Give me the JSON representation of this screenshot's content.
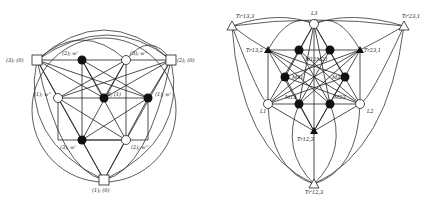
{
  "left_graph": {
    "nodes": [
      {
        "id": "a",
        "label": "(3); (0)",
        "shape": "square",
        "x": 37,
        "y": 60,
        "lx": 6,
        "ly": 62
      },
      {
        "id": "b",
        "label": "(2); w'",
        "shape": "filled",
        "x": 82,
        "y": 60,
        "lx": 62,
        "ly": 55
      },
      {
        "id": "c",
        "label": "(3); w''",
        "shape": "open",
        "x": 126,
        "y": 60,
        "lx": 130,
        "ly": 55
      },
      {
        "id": "d",
        "label": "(2); (0)",
        "shape": "square",
        "x": 171,
        "y": 60,
        "lx": 177,
        "ly": 62
      },
      {
        "id": "e",
        "label": "(1); w''",
        "shape": "open",
        "x": 58,
        "y": 98,
        "lx": 34,
        "ly": 96
      },
      {
        "id": "f",
        "label": "B; (1)",
        "shape": "filled",
        "x": 104,
        "y": 98,
        "lx": 107,
        "ly": 96
      },
      {
        "id": "g",
        "label": "(1); w'",
        "shape": "filled",
        "x": 148,
        "y": 98,
        "lx": 155,
        "ly": 96
      },
      {
        "id": "h",
        "label": "(3); w'",
        "shape": "filled",
        "x": 82,
        "y": 140,
        "lx": 60,
        "ly": 149
      },
      {
        "id": "i",
        "label": "(2); w''",
        "shape": "open",
        "x": 126,
        "y": 140,
        "lx": 131,
        "ly": 149
      },
      {
        "id": "j",
        "label": "(1); (0)",
        "shape": "square",
        "x": 104,
        "y": 180,
        "lx": 92,
        "ly": 192
      }
    ]
  },
  "right_graph": {
    "nodes": [
      {
        "id": "L3",
        "label": "L3",
        "shape": "open",
        "x": 314,
        "y": 24,
        "lx": 311,
        "ly": 15
      },
      {
        "id": "t13",
        "label": "Tr'13,3",
        "shape": "open-tri",
        "x": 232,
        "y": 26,
        "lx": 236,
        "ly": 18
      },
      {
        "id": "t23",
        "label": "Tr'23,1",
        "shape": "open-tri",
        "x": 404,
        "y": 26,
        "lx": 402,
        "ly": 18
      },
      {
        "id": "tr132",
        "label": "Tr13,2",
        "shape": "filled-tri",
        "x": 268,
        "y": 50,
        "lx": 246,
        "ly": 52
      },
      {
        "id": "tr231",
        "label": "Tr23,1",
        "shape": "filled-tri",
        "x": 360,
        "y": 50,
        "lx": 364,
        "ly": 52
      },
      {
        "id": "m1",
        "label": "",
        "shape": "filled",
        "x": 299,
        "y": 50,
        "lx": 0,
        "ly": 0
      },
      {
        "id": "m2",
        "label": "",
        "shape": "filled",
        "x": 330,
        "y": 50,
        "lx": 0,
        "ly": 0
      },
      {
        "id": "m12",
        "label": "M12M21",
        "shape": "none",
        "x": 314,
        "y": 58,
        "lx": 305,
        "ly": 61
      },
      {
        "id": "m31",
        "label": "M31",
        "shape": "filled",
        "x": 285,
        "y": 77,
        "lx": 292,
        "ly": 79
      },
      {
        "id": "m32",
        "label": "M32",
        "shape": "filled",
        "x": 345,
        "y": 77,
        "lx": 332,
        "ly": 79
      },
      {
        "id": "L1",
        "label": "L1",
        "shape": "open",
        "x": 268,
        "y": 104,
        "lx": 260,
        "ly": 113
      },
      {
        "id": "L2",
        "label": "L2",
        "shape": "open",
        "x": 360,
        "y": 104,
        "lx": 367,
        "ly": 113
      },
      {
        "id": "m13",
        "label": "M13",
        "shape": "filled",
        "x": 299,
        "y": 104,
        "lx": 285,
        "ly": 99
      },
      {
        "id": "m23",
        "label": "M23",
        "shape": "filled",
        "x": 330,
        "y": 104,
        "lx": 334,
        "ly": 99
      },
      {
        "id": "tr123",
        "label": "Tr12,3",
        "shape": "filled-tri",
        "x": 314,
        "y": 131,
        "lx": 297,
        "ly": 141
      },
      {
        "id": "t123",
        "label": "Tr'12,3",
        "shape": "open-tri",
        "x": 314,
        "y": 184,
        "lx": 305,
        "ly": 194
      }
    ]
  }
}
